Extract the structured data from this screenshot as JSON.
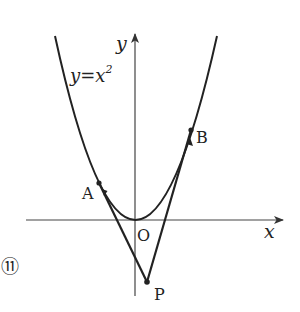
{
  "figure": {
    "number_label": "⑪",
    "curve_label": "y=x",
    "curve_exponent": "2",
    "axis_x_label": "x",
    "axis_y_label": "y",
    "origin_label": "O",
    "points": {
      "A": "A",
      "B": "B",
      "P": "P"
    }
  },
  "colors": {
    "stroke": "#222222",
    "axis": "#444444",
    "background": "#ffffff"
  }
}
